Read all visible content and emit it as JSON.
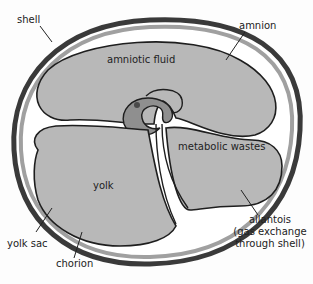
{
  "diagram": {
    "colors": {
      "background": "#fdfdfd",
      "shell": "#4a4a4a",
      "membrane_gap": "#ffffff",
      "chorion_band": "#9a9a9a",
      "compartment_fill": "#b8b8b8",
      "embryo_fill": "#8f8f8f",
      "outline": "#1e1e1e"
    },
    "labels": {
      "shell": "shell",
      "amnion": "amnion",
      "amniotic_fluid": "amniotic fluid",
      "metabolic_wastes": "metabolic wastes",
      "yolk": "yolk",
      "yolk_sac": "yolk sac",
      "chorion": "chorion",
      "allantois_line1": "allantois",
      "allantois_line2": "(gas exchange",
      "allantois_line3": "through shell)"
    }
  }
}
